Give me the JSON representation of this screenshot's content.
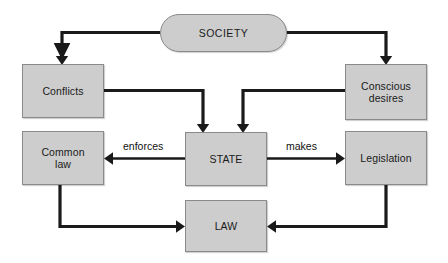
{
  "diagram": {
    "type": "flowchart",
    "background_color": "#ffffff",
    "node_fill_color": "#cdcdcd",
    "node_border_color": "#8a8a8a",
    "connector_color": "#1a1a1a",
    "nodes": [
      {
        "id": "society",
        "label": "SOCIETY",
        "shape": "rounded-rectangle",
        "x": 160,
        "y": 14,
        "w": 127,
        "h": 38
      },
      {
        "id": "conflicts",
        "label": "Conflicts",
        "shape": "rectangle",
        "x": 22,
        "y": 64,
        "w": 82,
        "h": 54
      },
      {
        "id": "conscious-desires",
        "label": "Conscious\ndesires",
        "shape": "rectangle",
        "x": 345,
        "y": 64,
        "w": 82,
        "h": 56
      },
      {
        "id": "common-law",
        "label": "Common\nlaw",
        "shape": "rectangle",
        "x": 22,
        "y": 131,
        "w": 82,
        "h": 54
      },
      {
        "id": "state",
        "label": "STATE",
        "shape": "rectangle",
        "x": 185,
        "y": 132,
        "w": 82,
        "h": 54
      },
      {
        "id": "legislation",
        "label": "Legislation",
        "shape": "rectangle",
        "x": 345,
        "y": 131,
        "w": 82,
        "h": 54
      },
      {
        "id": "law",
        "label": "LAW",
        "shape": "rectangle",
        "x": 185,
        "y": 200,
        "w": 82,
        "h": 52
      }
    ],
    "edges": [
      {
        "id": "society-to-conflicts",
        "from": "society",
        "to": "conflicts",
        "label": ""
      },
      {
        "id": "society-to-conscious-desires",
        "from": "society",
        "to": "conscious-desires",
        "label": ""
      },
      {
        "id": "conflicts-to-state",
        "from": "conflicts",
        "to": "state",
        "label": ""
      },
      {
        "id": "conscious-desires-to-state",
        "from": "conscious-desires",
        "to": "state",
        "label": ""
      },
      {
        "id": "state-to-common-law",
        "from": "state",
        "to": "common-law",
        "label": "enforces"
      },
      {
        "id": "state-to-legislation",
        "from": "state",
        "to": "legislation",
        "label": "makes"
      },
      {
        "id": "common-law-to-law",
        "from": "common-law",
        "to": "law",
        "label": ""
      },
      {
        "id": "legislation-to-law",
        "from": "legislation",
        "to": "law",
        "label": ""
      }
    ],
    "edge_labels": {
      "enforces": "enforces",
      "makes": "makes"
    }
  }
}
